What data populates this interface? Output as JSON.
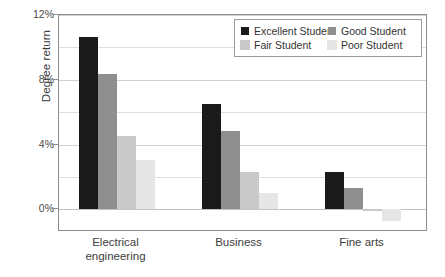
{
  "chart_data": {
    "type": "bar",
    "title": "",
    "xlabel": "",
    "ylabel": "Degree return",
    "categories": [
      "Electrical engineering",
      "Business",
      "Fine arts"
    ],
    "category_lines": [
      [
        "Electrical",
        "engineering"
      ],
      [
        "Business"
      ],
      [
        "Fine arts"
      ]
    ],
    "series": [
      {
        "name": "Excellent Student",
        "color": "#1a1a1a",
        "values": [
          10.65,
          6.5,
          2.3
        ]
      },
      {
        "name": "Good Student",
        "color": "#8f8f8f",
        "values": [
          8.35,
          4.85,
          1.3
        ]
      },
      {
        "name": "Fair Student",
        "color": "#c9c9c9",
        "values": [
          4.55,
          2.3,
          -0.1
        ]
      },
      {
        "name": "Poor Student",
        "color": "#e6e6e6",
        "values": [
          3.05,
          1.0,
          -0.7
        ]
      }
    ],
    "ylim": [
      -1.4,
      12
    ],
    "ytick_values": [
      0,
      4,
      8,
      12
    ],
    "ytick_labels": [
      "0%",
      "4%",
      "8%",
      "12%"
    ],
    "gridlines_minor": [
      2,
      6,
      10
    ],
    "grid": true,
    "legend_position": "top-right"
  },
  "legend": {
    "entries": [
      {
        "label": "Excellent Student",
        "color": "#1a1a1a"
      },
      {
        "label": "Good Student",
        "color": "#8f8f8f"
      },
      {
        "label": "Fair Student",
        "color": "#c9c9c9"
      },
      {
        "label": "Poor Student",
        "color": "#e6e6e6"
      }
    ]
  },
  "axis": {
    "y_title": "Degree return"
  }
}
